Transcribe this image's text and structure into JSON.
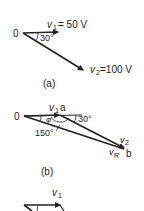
{
  "figure_a": {
    "origin_label": "0",
    "v1_symbol": "v",
    "v1_sub": "1",
    "v1_value": "= 50 V",
    "angle_label": "30°",
    "v2_symbol": "v",
    "v2_sub": "2",
    "v2_value": "=100 V",
    "caption": "(a)"
  },
  "figure_b": {
    "origin_label": "0",
    "v1_symbol": "v",
    "v1_sub": "1",
    "point_a": "a",
    "angle_30": "30°",
    "phi": "φ",
    "angle_150": "150°",
    "v2_symbol": "v",
    "v2_sub": "2",
    "vr_symbol": "v",
    "vr_sub": "R",
    "point_b": "b",
    "caption": "(b)"
  },
  "figure_c": {
    "v1_symbol": "v",
    "v1_sub": "1"
  },
  "colors": {
    "ink": "#222222",
    "background": "#ffffff"
  }
}
